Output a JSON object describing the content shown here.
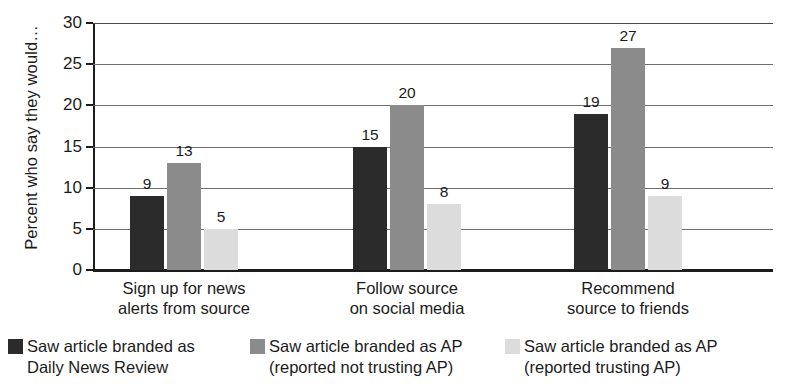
{
  "chart_data": {
    "type": "bar",
    "title": "",
    "subtitle": "",
    "xlabel": "",
    "ylabel": "Percent who say they would…",
    "ylim": [
      0,
      30
    ],
    "ytick_step": 5,
    "yticks": [
      "30",
      "25",
      "20",
      "15",
      "10",
      "5",
      "0"
    ],
    "grid": true,
    "grid_axis": "y",
    "legend_position": "bottom",
    "categories": [
      "Sign up for news\nalerts from source",
      "Follow source\non social media",
      "Recommend\nsource to friends"
    ],
    "category_lines": [
      [
        "Sign up for news",
        "alerts from source"
      ],
      [
        "Follow source",
        "on social media"
      ],
      [
        "Recommend",
        "source to friends"
      ]
    ],
    "series": [
      {
        "name": "Saw article branded as\nDaily News Review",
        "name_lines": [
          "Saw article branded as",
          "Daily News Review"
        ],
        "color": "#2b2b2b",
        "values": [
          9,
          13,
          19
        ]
      },
      {
        "name": "Saw article branded as AP\n(reported not trusting AP)",
        "name_lines": [
          "Saw article branded as AP",
          "(reported not trusting AP)"
        ],
        "color": "#8b8b8b",
        "values": [
          13,
          20,
          27
        ]
      },
      {
        "name": "Saw article branded as AP\n(reported trusting AP)",
        "name_lines": [
          "Saw article branded as AP",
          "(reported trusting AP)"
        ],
        "color": "#dcdcdc",
        "values": [
          5,
          8,
          9
        ]
      }
    ],
    "data_labels": [
      [
        "9",
        "13",
        "5"
      ],
      [
        "15",
        "20",
        "8"
      ],
      [
        "19",
        "27",
        "9"
      ]
    ],
    "values_by_group": [
      [
        9,
        13,
        5
      ],
      [
        15,
        20,
        8
      ],
      [
        19,
        27,
        9
      ]
    ],
    "axis_color": "#1c1c1c",
    "grid_color": "#6f6f6f",
    "background": "#ffffff"
  },
  "layout": {
    "plot_left": 93,
    "plot_top": 23,
    "plot_width": 680,
    "plot_height": 247,
    "bar_width": 34,
    "group_starts": [
      130,
      353,
      574
    ],
    "legend_item_lefts": [
      8,
      250,
      505
    ]
  }
}
